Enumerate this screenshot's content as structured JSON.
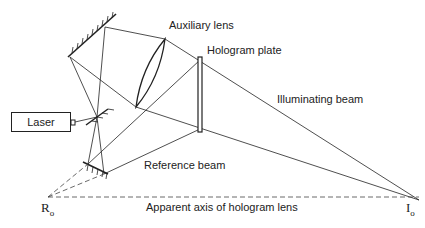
{
  "diagram": {
    "labels": {
      "auxiliary_lens": "Auxiliary lens",
      "hologram_plate": "Hologram plate",
      "illuminating_beam": "Illuminating beam",
      "reference_beam": "Reference beam",
      "laser": "Laser",
      "apparent_axis": "Apparent axis of hologram lens",
      "r_point": "R",
      "r_sub": "o",
      "i_point": "I",
      "i_sub": "o"
    },
    "components": [
      "laser",
      "beam splitter",
      "upper mirror",
      "lower mirror",
      "auxiliary lens",
      "hologram plate"
    ],
    "colors": {
      "line": "#222222",
      "dashed": "#444444"
    }
  }
}
